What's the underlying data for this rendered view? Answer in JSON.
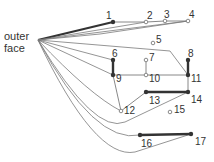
{
  "outer_face_label": [
    "outer",
    "face"
  ],
  "apex": [
    38,
    40
  ],
  "colors": {
    "line": "#555555",
    "thin": "#7a7a7a",
    "bold": "#333333",
    "node": "#333333",
    "node_light": "#888888"
  },
  "nodes": [
    {
      "id": "1",
      "x": 113,
      "y": 22,
      "lx": 106,
      "ly": 11,
      "type": "dark"
    },
    {
      "id": "2",
      "x": 146,
      "y": 22,
      "lx": 147,
      "ly": 11,
      "type": "light"
    },
    {
      "id": "3",
      "x": 165,
      "y": 21,
      "lx": 164,
      "ly": 10,
      "type": "light"
    },
    {
      "id": "4",
      "x": 188,
      "y": 21,
      "lx": 189,
      "ly": 10,
      "type": "light"
    },
    {
      "id": "5",
      "x": 153,
      "y": 43,
      "lx": 156,
      "ly": 35,
      "type": "light"
    },
    {
      "id": "6",
      "x": 113,
      "y": 60,
      "lx": 112,
      "ly": 49,
      "type": "dark"
    },
    {
      "id": "7",
      "x": 146,
      "y": 60,
      "lx": 149,
      "ly": 53,
      "type": "light"
    },
    {
      "id": "8",
      "x": 188,
      "y": 60,
      "lx": 188,
      "ly": 49,
      "type": "dark"
    },
    {
      "id": "9",
      "x": 113,
      "y": 75,
      "lx": 116,
      "ly": 74,
      "type": "dark"
    },
    {
      "id": "10",
      "x": 146,
      "y": 75,
      "lx": 149,
      "ly": 74,
      "type": "light"
    },
    {
      "id": "11",
      "x": 188,
      "y": 75,
      "lx": 191,
      "ly": 74,
      "type": "dark"
    },
    {
      "id": "12",
      "x": 121,
      "y": 111,
      "lx": 124,
      "ly": 106,
      "type": "light"
    },
    {
      "id": "13",
      "x": 146,
      "y": 92,
      "lx": 149,
      "ly": 96,
      "type": "dark"
    },
    {
      "id": "14",
      "x": 188,
      "y": 92,
      "lx": 191,
      "ly": 95,
      "type": "dark"
    },
    {
      "id": "15",
      "x": 170,
      "y": 112,
      "lx": 174,
      "ly": 105,
      "type": "light"
    },
    {
      "id": "16",
      "x": 140,
      "y": 135,
      "lx": 141,
      "ly": 139,
      "type": "dark"
    },
    {
      "id": "17",
      "x": 191,
      "y": 134,
      "lx": 195,
      "ly": 137,
      "type": "dark"
    }
  ],
  "edges": [
    {
      "from": "1",
      "to": "2",
      "style": "thin"
    },
    {
      "from": "2",
      "to": "3",
      "style": "thin"
    },
    {
      "from": "3",
      "to": "4",
      "style": "thin"
    },
    {
      "from": "6",
      "to": "9",
      "style": "bold"
    },
    {
      "from": "8",
      "to": "11",
      "style": "bold"
    },
    {
      "from": "9",
      "to": "10",
      "style": "thin"
    },
    {
      "from": "10",
      "to": "11",
      "style": "thin"
    },
    {
      "from": "7",
      "to": "10",
      "style": "thin"
    },
    {
      "from": "9",
      "to": "12",
      "style": "thin"
    },
    {
      "from": "12",
      "to": "13",
      "style": "thin"
    },
    {
      "from": "13",
      "to": "14",
      "style": "bold"
    },
    {
      "from": "11",
      "to": "14",
      "style": "thin"
    },
    {
      "from": "16",
      "to": "17",
      "style": "bold"
    }
  ],
  "apex_edges": [
    {
      "d": "M38,40 L113,22",
      "style": "bold"
    },
    {
      "d": "M38,40 L146,22",
      "style": "thin"
    },
    {
      "d": "M38,40 L188,21",
      "style": "thin"
    },
    {
      "d": "M38,40 L100,34 L188,21",
      "style": "thin"
    },
    {
      "d": "M38,40 L170,51 L188,75",
      "style": "thin"
    },
    {
      "d": "M38,40 L113,60",
      "style": "thin"
    },
    {
      "d": "M38,40 L113,75",
      "style": "thin"
    },
    {
      "d": "M38,40 Q90,95 121,111",
      "style": "thin"
    },
    {
      "d": "M38,40 Q95,135 125,122 L188,92",
      "style": "thin"
    },
    {
      "d": "M38,40 Q95,145 140,135",
      "style": "thin"
    },
    {
      "d": "M38,40 Q95,160 135,152 L191,134",
      "style": "thin"
    }
  ]
}
